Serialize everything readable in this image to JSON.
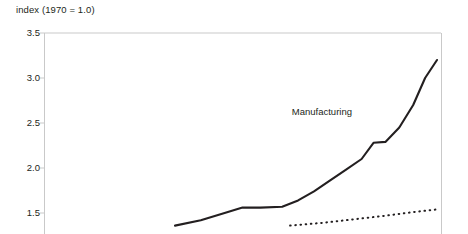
{
  "chart_data": {
    "type": "line",
    "title": "",
    "subtitle": "",
    "ylabel": "index (1970 = 1.0)",
    "xlabel": "",
    "ylim": [
      1.35,
      3.5
    ],
    "yticks": [
      3.5,
      3.0,
      2.5,
      2.0,
      1.5
    ],
    "ytick_labels": [
      "3.5",
      "3.0",
      "2.5",
      "2.0",
      "1.5"
    ],
    "grid": false,
    "legend_position": "inline-annotation",
    "annotations": [
      {
        "text": "Manufacturing",
        "x": 0.74,
        "y": 2.62
      }
    ],
    "series": [
      {
        "name": "Manufacturing",
        "style": "solid",
        "color": "#231f20",
        "x": [
          0.33,
          0.395,
          0.455,
          0.5,
          0.545,
          0.6,
          0.64,
          0.68,
          0.72,
          0.76,
          0.8,
          0.83,
          0.86,
          0.895,
          0.93,
          0.96,
          0.99
        ],
        "values": [
          1.36,
          1.42,
          1.5,
          1.56,
          1.56,
          1.57,
          1.64,
          1.74,
          1.86,
          1.98,
          2.1,
          2.28,
          2.29,
          2.45,
          2.7,
          3.0,
          3.2
        ]
      },
      {
        "name": "second-series",
        "style": "dotted",
        "color": "#231f20",
        "x": [
          0.62,
          0.7,
          0.78,
          0.86,
          0.93,
          0.99
        ],
        "values": [
          1.36,
          1.39,
          1.43,
          1.47,
          1.51,
          1.54
        ]
      }
    ]
  },
  "colors": {
    "axis": "#c9c9c9",
    "text": "#231f20",
    "line": "#231f20",
    "background": "#ffffff"
  }
}
